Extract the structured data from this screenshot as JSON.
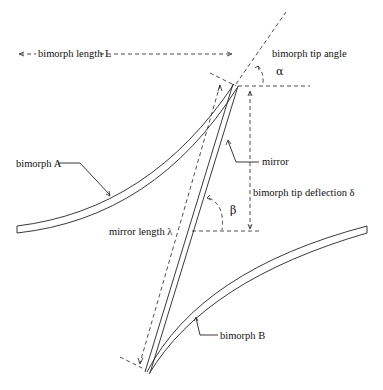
{
  "diagram": {
    "labels": {
      "bimorph_length": "bimorph length L",
      "bimorph_tip_angle": "bimorph tip angle",
      "alpha": "α",
      "bimorph_a": "bimorph A",
      "mirror": "mirror",
      "bimorph_tip_deflection": "bimorph tip deflection δ",
      "beta": "β",
      "mirror_length": "mirror length  λ",
      "bimorph_b": "bimorph B"
    },
    "colors": {
      "line": "#222222",
      "background": "#ffffff"
    }
  }
}
